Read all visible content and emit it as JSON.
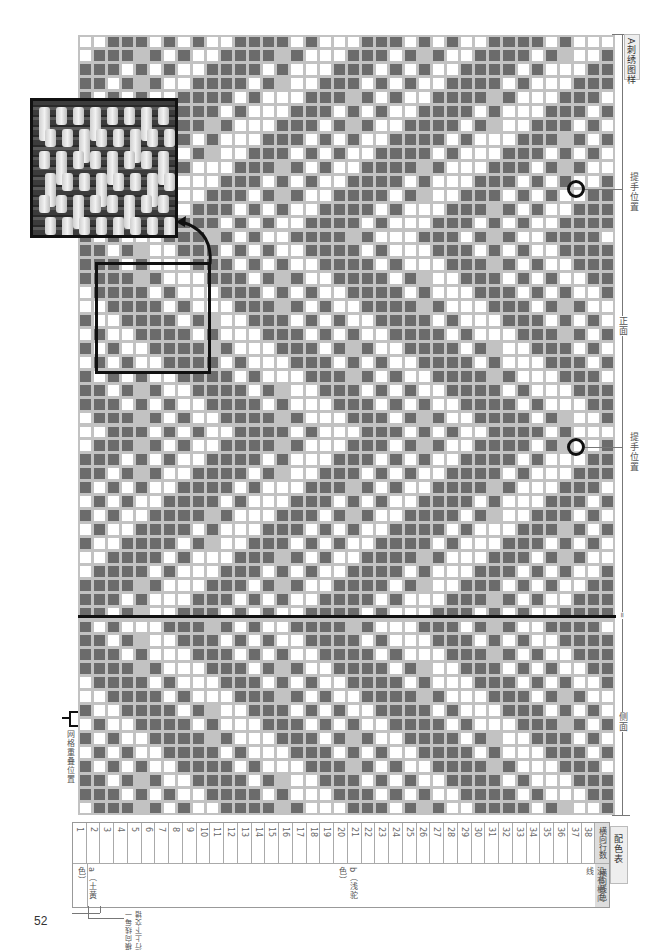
{
  "page": {
    "page_number": "52",
    "colors": {
      "dark": "#6b6b6b",
      "light_grid": "#c2c2c2",
      "white": "#ffffff",
      "ink": "#111111"
    }
  },
  "chart": {
    "title": "A刺绣图样",
    "cols": 38,
    "rows": 56,
    "pattern": "chevron",
    "labels": {
      "handle_position_1": "提手位置",
      "handle_position_2": "提手位置",
      "front": "正面",
      "side": "侧面",
      "center_mark": "=",
      "net_overlap": "网格重叠位置"
    }
  },
  "inset_photo": {
    "description": "woven-stitch close-up photo",
    "arrow": "curved-arrow"
  },
  "color_table": {
    "title": "配色表",
    "header_rows_label": "横向行数",
    "header_color_label": "横向线色",
    "row_numbers": [
      "1",
      "2",
      "3",
      "4",
      "5",
      "6",
      "7",
      "8",
      "9",
      "10",
      "11",
      "12",
      "13",
      "14",
      "15",
      "16",
      "17",
      "18",
      "19",
      "20",
      "21",
      "22",
      "23",
      "24",
      "25",
      "26",
      "27",
      "28",
      "29",
      "30",
      "31",
      "32",
      "33",
      "34",
      "35",
      "36",
      "37",
      "38"
    ],
    "color_a": "a（土黄色）",
    "color_b": "b（浅驼色）",
    "no_weft": "没有横向线",
    "footnote": "横向线每一行上下交错"
  }
}
